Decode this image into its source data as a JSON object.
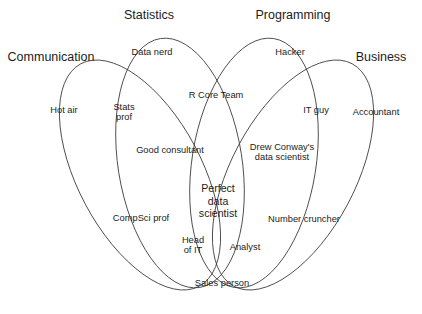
{
  "figure": {
    "name": "data-science-venn-diagram",
    "background_color": "#ffffff",
    "stroke_color": "#3a3a3a",
    "text_color": "#1c1c1c"
  },
  "sets": [
    {
      "id": "communication",
      "label": "Communication"
    },
    {
      "id": "statistics",
      "label": "Statistics"
    },
    {
      "id": "programming",
      "label": "Programming"
    },
    {
      "id": "business",
      "label": "Business"
    }
  ],
  "regions": [
    {
      "id": "hot-air",
      "label": "Hot air"
    },
    {
      "id": "data-nerd",
      "label": "Data nerd"
    },
    {
      "id": "hacker",
      "label": "Hacker"
    },
    {
      "id": "accountant",
      "label": "Accountant"
    },
    {
      "id": "stats-prof",
      "label": "Stats\nprof"
    },
    {
      "id": "r-core-team",
      "label": "R Core Team"
    },
    {
      "id": "it-guy",
      "label": "IT guy"
    },
    {
      "id": "good-consultant",
      "label": "Good consultant"
    },
    {
      "id": "drew-conway",
      "label": "Drew Conway's\ndata scientist"
    },
    {
      "id": "compsci-prof",
      "label": "CompSci prof"
    },
    {
      "id": "number-cruncher",
      "label": "Number cruncher"
    },
    {
      "id": "perfect-data-scientist",
      "label": "Perfect\ndata\nscientist"
    },
    {
      "id": "head-of-it",
      "label": "Head\nof IT"
    },
    {
      "id": "analyst",
      "label": "Analyst"
    },
    {
      "id": "sales-person",
      "label": "Sales person"
    }
  ]
}
